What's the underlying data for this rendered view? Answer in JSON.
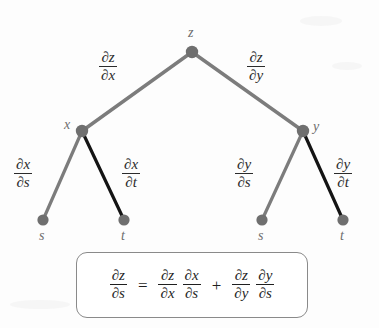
{
  "diagram": {
    "colors": {
      "gray_edge": "#7c7c7c",
      "black_edge": "#141414",
      "node_fill": "#7a7a7a",
      "label_gray": "#6e6e6e",
      "text": "#2b2b2b",
      "box_border": "#8a8a8a",
      "background": "#fdfdfd"
    },
    "nodes": [
      {
        "id": "z",
        "label": "z",
        "x": 192,
        "y": 52,
        "label_x": 188,
        "label_y": 30
      },
      {
        "id": "x",
        "label": "x",
        "x": 82,
        "y": 131,
        "label_x": 64,
        "label_y": 122
      },
      {
        "id": "y",
        "label": "y",
        "x": 303,
        "y": 131,
        "label_x": 313,
        "label_y": 123
      },
      {
        "id": "s1",
        "label": "s",
        "x": 43,
        "y": 220,
        "label_x": 39,
        "label_y": 231
      },
      {
        "id": "t1",
        "label": "t",
        "x": 124,
        "y": 220,
        "label_x": 121,
        "label_y": 231
      },
      {
        "id": "s2",
        "label": "s",
        "x": 262,
        "y": 220,
        "label_x": 258,
        "label_y": 231
      },
      {
        "id": "t2",
        "label": "t",
        "x": 343,
        "y": 220,
        "label_x": 340,
        "label_y": 231
      }
    ],
    "edges": [
      {
        "id": "z-x",
        "from": "z",
        "to": "x",
        "color": "gray",
        "label_num": "∂z",
        "label_den": "∂x"
      },
      {
        "id": "z-y",
        "from": "z",
        "to": "y",
        "color": "gray",
        "label_num": "∂z",
        "label_den": "∂y"
      },
      {
        "id": "x-s",
        "from": "x",
        "to": "s1",
        "color": "gray",
        "label_num": "∂x",
        "label_den": "∂s"
      },
      {
        "id": "x-t",
        "from": "x",
        "to": "t1",
        "color": "black",
        "label_num": "∂x",
        "label_den": "∂t"
      },
      {
        "id": "y-s",
        "from": "y",
        "to": "s2",
        "color": "gray",
        "label_num": "∂y",
        "label_den": "∂s"
      },
      {
        "id": "y-t",
        "from": "y",
        "to": "t2",
        "color": "black",
        "label_num": "∂y",
        "label_den": "∂t"
      }
    ],
    "edge_labels": {
      "zx": {
        "num": "∂z",
        "den": "∂x",
        "x": 100,
        "y": 52
      },
      "zy": {
        "num": "∂z",
        "den": "∂y",
        "x": 248,
        "y": 52
      },
      "xs": {
        "num": "∂x",
        "den": "∂s",
        "x": 14,
        "y": 159
      },
      "xt": {
        "num": "∂x",
        "den": "∂t",
        "x": 122,
        "y": 159
      },
      "ys": {
        "num": "∂y",
        "den": "∂s",
        "x": 235,
        "y": 159
      },
      "yt": {
        "num": "∂y",
        "den": "∂t",
        "x": 334,
        "y": 159
      }
    },
    "formula": {
      "lhs": {
        "num": "∂z",
        "den": "∂s"
      },
      "equals": "=",
      "term1_a": {
        "num": "∂z",
        "den": "∂x"
      },
      "term1_b": {
        "num": "∂x",
        "den": "∂s"
      },
      "plus": "+",
      "term2_a": {
        "num": "∂z",
        "den": "∂y"
      },
      "term2_b": {
        "num": "∂y",
        "den": "∂s"
      },
      "plain_text": "∂z/∂s = ∂z/∂x · ∂x/∂s + ∂z/∂y · ∂y/∂s"
    }
  }
}
